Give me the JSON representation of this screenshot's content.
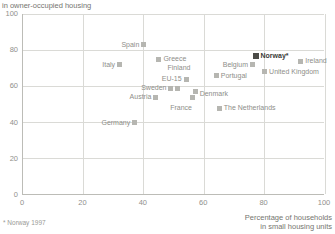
{
  "footnote": "* Norway 1997",
  "chart_data": {
    "type": "scatter",
    "ylabel": "in owner-occupied housing",
    "xlabel_line1": "Percentage of households",
    "xlabel_line2": "in small housing units",
    "xlim": [
      0,
      100
    ],
    "ylim": [
      0,
      100
    ],
    "xticks": [
      0,
      20,
      40,
      60,
      80,
      100
    ],
    "yticks": [
      0,
      20,
      40,
      60,
      80,
      100
    ],
    "grid": true,
    "points": [
      {
        "label": "Spain",
        "x": 40,
        "y": 83,
        "pos": "left"
      },
      {
        "label": "Italy",
        "x": 32,
        "y": 72,
        "pos": "left"
      },
      {
        "label": "Greece",
        "x": 45,
        "y": 75,
        "pos": "right"
      },
      {
        "label": "Finland",
        "x": 51,
        "y": 59,
        "pos": "above",
        "dx": 2,
        "dy": -12
      },
      {
        "label": "EU-15",
        "x": 54,
        "y": 64,
        "pos": "left"
      },
      {
        "label": "Sweden",
        "x": 49,
        "y": 59,
        "pos": "left"
      },
      {
        "label": "Austria",
        "x": 44,
        "y": 54,
        "pos": "left"
      },
      {
        "label": "Germany",
        "x": 37,
        "y": 40,
        "pos": "left"
      },
      {
        "label": "France",
        "x": 56,
        "y": 54,
        "pos": "below",
        "dx": -11,
        "dy": 2
      },
      {
        "label": "Denmark",
        "x": 57,
        "y": 57,
        "pos": "right",
        "dy": 2
      },
      {
        "label": "The Netherlands",
        "x": 65,
        "y": 48,
        "pos": "right"
      },
      {
        "label": "Portugal",
        "x": 64,
        "y": 66,
        "pos": "right"
      },
      {
        "label": "Belgium",
        "x": 76,
        "y": 72,
        "pos": "left"
      },
      {
        "label": "Norway*",
        "x": 77,
        "y": 77,
        "pos": "right",
        "emphasis": true
      },
      {
        "label": "United Kingdom",
        "x": 80,
        "y": 68,
        "pos": "right"
      },
      {
        "label": "Ireland",
        "x": 92,
        "y": 74,
        "pos": "right"
      }
    ],
    "colors": {
      "marker": "#b6b6b1",
      "marker_emphasis": "#4b4b47",
      "label": "#8e8e89",
      "label_emphasis": "#3a3a38",
      "grid": "#dadad6",
      "axis": "#bcbcb7",
      "tick_text": "#90908c",
      "axis_title_text": "#75756f",
      "background": "#ffffff"
    }
  }
}
